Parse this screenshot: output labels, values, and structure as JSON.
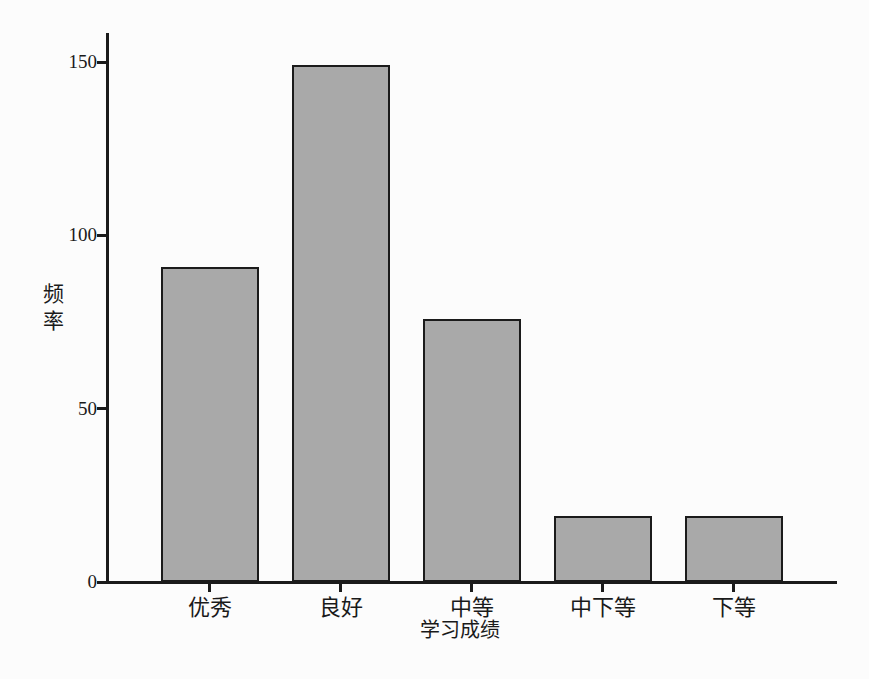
{
  "chart_data": {
    "type": "bar",
    "title": "",
    "categories": [
      "优秀",
      "良好",
      "中等",
      "中下等",
      "下等"
    ],
    "values": [
      91,
      149,
      76,
      19,
      19
    ],
    "xlabel": "学习成绩",
    "ylabel": "频率",
    "yticks": [
      0,
      50,
      100,
      150
    ],
    "ylim": [
      0,
      158
    ],
    "grid": false,
    "legend_position": "none",
    "bar_fill_color": "#a9a9a9",
    "bar_border_color": "#1b1b1b",
    "axis_color": "#1b1b1b",
    "text_color": "#1a1a1a",
    "background_color": "#fcfcfc"
  }
}
